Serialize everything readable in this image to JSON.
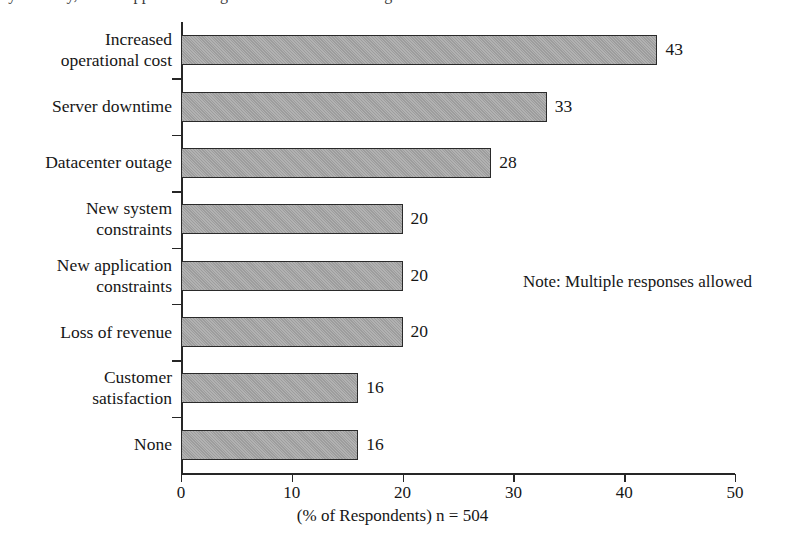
{
  "chart_data": {
    "type": "bar",
    "orientation": "horizontal",
    "title": "",
    "xlabel": "(% of Respondents) n = 504",
    "ylabel": "",
    "categories": [
      "Increased\noperational cost",
      "Server downtime",
      "Datacenter outage",
      "New system\nconstraints",
      "New application\nconstraints",
      "Loss of revenue",
      "Customer\nsatisfaction",
      "None"
    ],
    "values": [
      43,
      33,
      28,
      20,
      20,
      20,
      16,
      16
    ],
    "value_labels": [
      "43",
      "33",
      "28",
      "20",
      "20",
      "20",
      "16",
      "16"
    ],
    "xlim": [
      0,
      50
    ],
    "xticks": [
      0,
      10,
      20,
      30,
      40,
      50
    ],
    "xtick_labels": [
      "0",
      "10",
      "20",
      "30",
      "40",
      "50"
    ],
    "grid": false,
    "legend": false,
    "bar_color": "#a5a5a5",
    "bar_border_color": "#2a2a2a",
    "axis_color": "#262626",
    "annotations": [
      {
        "text": "Note: Multiple responses allowed"
      }
    ]
  },
  "caption": {
    "x_axis": "(% of Respondents) n = 504"
  },
  "title_sliver": {
    "text": "by industry, what happened during the last datacenter outage"
  }
}
